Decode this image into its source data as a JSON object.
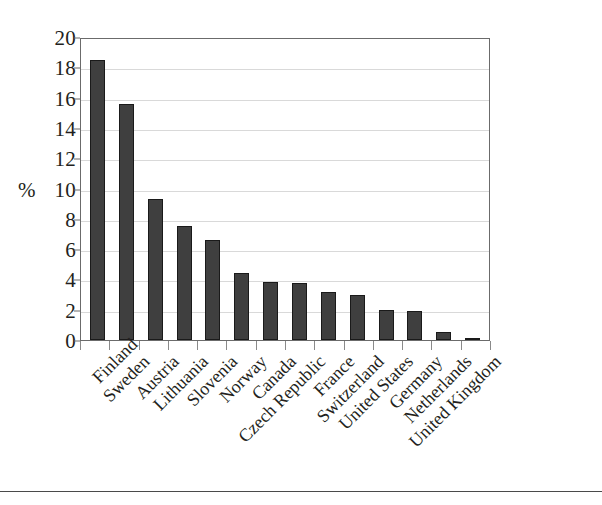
{
  "chart_data": {
    "type": "bar",
    "title": "",
    "xlabel": "",
    "ylabel": "%",
    "ylim": [
      0,
      20
    ],
    "ytick_step": 2,
    "yticks": [
      "20",
      "18",
      "16",
      "14",
      "12",
      "10",
      "8",
      "6",
      "4",
      "2",
      "0"
    ],
    "grid": true,
    "legend": "none",
    "orientation": "vertical",
    "bar_color": "#3f3f3f",
    "bar_edge_color": "#1a1a1a",
    "plot_border_color": "#6b6b6b",
    "gridline_color": "#d9d9d9",
    "label_rotation_deg": -45,
    "categories": [
      "Finland",
      "Sweden",
      "Austria",
      "Lithuania",
      "Slovenia",
      "Norway",
      "Canada",
      "Czech Republic",
      "France",
      "Switzerland",
      "United States",
      "Germany",
      "Netherlands",
      "United Kingdom"
    ],
    "values": [
      18.5,
      15.6,
      9.3,
      7.5,
      6.6,
      4.4,
      3.8,
      3.75,
      3.2,
      3.0,
      1.95,
      1.9,
      0.5,
      0.15
    ]
  }
}
